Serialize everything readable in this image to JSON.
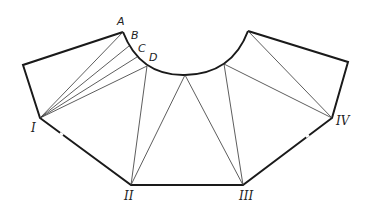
{
  "diagram": {
    "arc_labels": [
      {
        "id": "A",
        "text": "A",
        "x": 117,
        "y": 25
      },
      {
        "id": "B",
        "text": "B",
        "x": 131,
        "y": 39
      },
      {
        "id": "C",
        "text": "C",
        "x": 138,
        "y": 52
      },
      {
        "id": "D",
        "text": "D",
        "x": 149,
        "y": 61
      }
    ],
    "corner_labels": [
      {
        "id": "I",
        "text": "I",
        "x": 31,
        "y": 132
      },
      {
        "id": "II",
        "text": "II",
        "x": 124,
        "y": 200
      },
      {
        "id": "III",
        "text": "III",
        "x": 239,
        "y": 200
      },
      {
        "id": "IV",
        "text": "IV",
        "x": 336,
        "y": 125
      }
    ],
    "points": {
      "outer_left": [
        23,
        65
      ],
      "A": [
        123,
        32
      ],
      "B": [
        129,
        46
      ],
      "C": [
        137,
        57
      ],
      "D": [
        147,
        66
      ],
      "arc_bottom": [
        185,
        75
      ],
      "arc_right": [
        224,
        64
      ],
      "top_right": [
        248,
        31
      ],
      "outer_right": [
        348,
        62
      ],
      "I": [
        40,
        118
      ],
      "II": [
        131,
        185
      ],
      "III": [
        243,
        185
      ],
      "IV": [
        332,
        118
      ]
    },
    "colors": {
      "outline": "#1a1a1a",
      "construction": "#333333",
      "background": "#ffffff"
    }
  }
}
